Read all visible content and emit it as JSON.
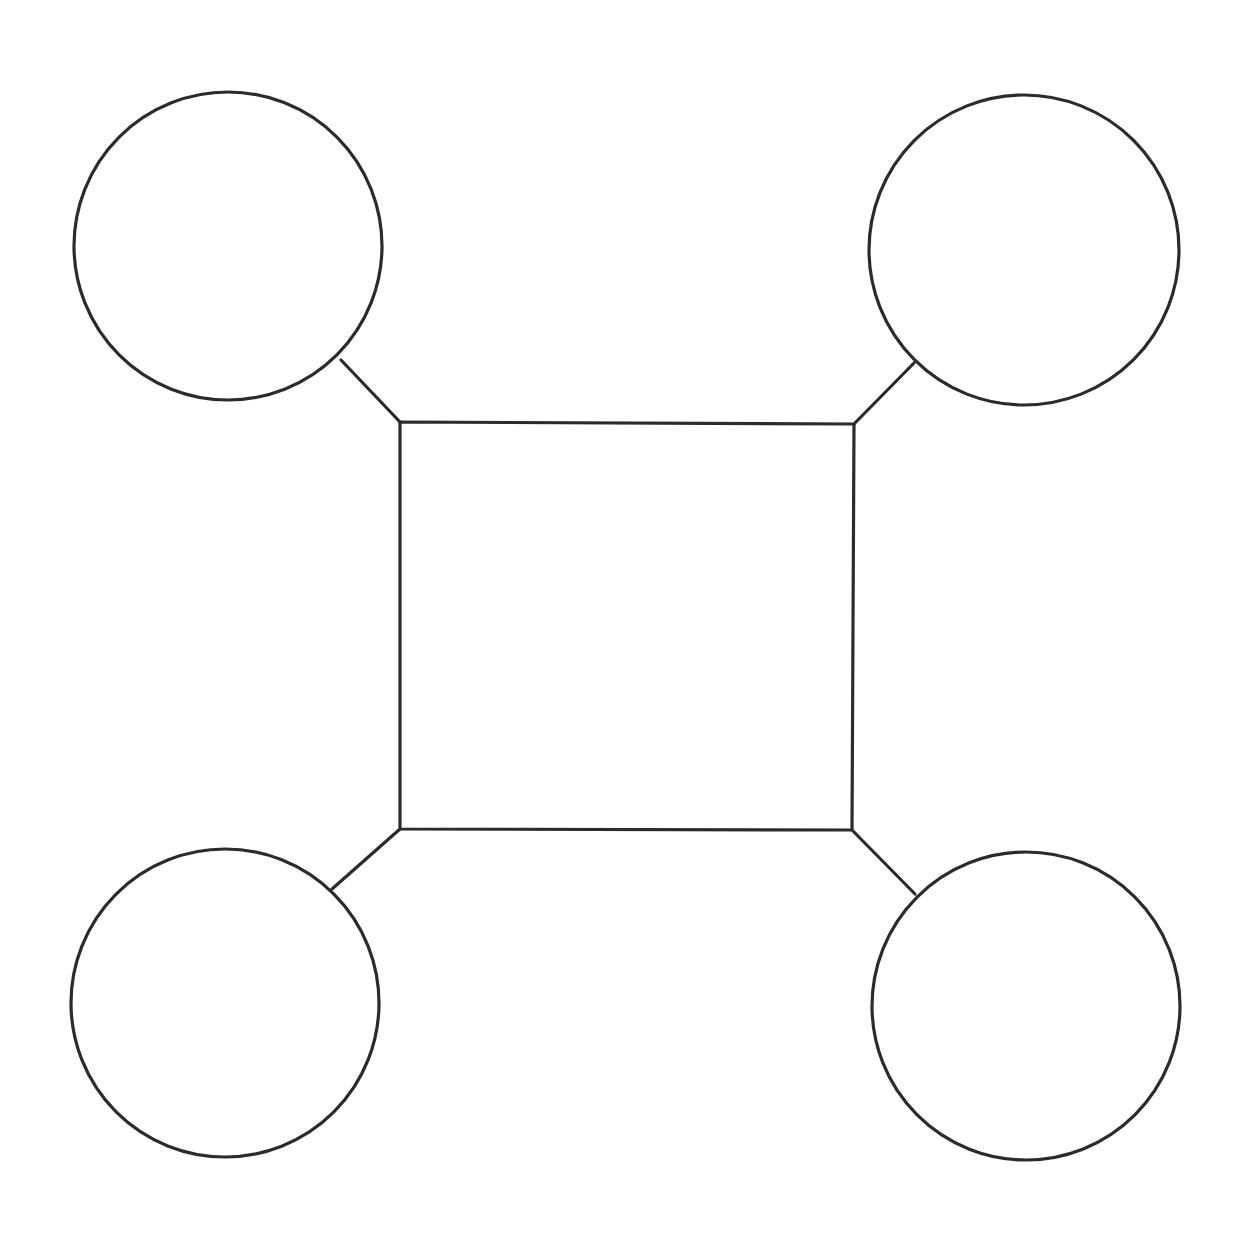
{
  "diagram": {
    "type": "hub-and-spoke",
    "canvas": {
      "width": 1254,
      "height": 1256,
      "background": "#ffffff"
    },
    "stroke_color": "#2b2b2b",
    "center_box": {
      "label": "",
      "corners": {
        "tl": [
          400,
          422
        ],
        "tr": [
          854,
          424
        ],
        "br": [
          852,
          830
        ],
        "bl": [
          400,
          829
        ]
      }
    },
    "nodes": [
      {
        "id": "top-left",
        "label": "",
        "cx": 228,
        "cy": 246,
        "r": 154,
        "link_from": [
          341,
          360
        ],
        "link_to": [
          400,
          422
        ]
      },
      {
        "id": "top-right",
        "label": "",
        "cx": 1024,
        "cy": 250,
        "r": 155,
        "link_from": [
          914,
          363
        ],
        "link_to": [
          854,
          424
        ]
      },
      {
        "id": "bottom-left",
        "label": "",
        "cx": 225,
        "cy": 1003,
        "r": 154,
        "link_from": [
          332,
          889
        ],
        "link_to": [
          400,
          829
        ]
      },
      {
        "id": "bottom-right",
        "label": "",
        "cx": 1026,
        "cy": 1006,
        "r": 154,
        "link_from": [
          915,
          894
        ],
        "link_to": [
          852,
          830
        ]
      }
    ]
  }
}
